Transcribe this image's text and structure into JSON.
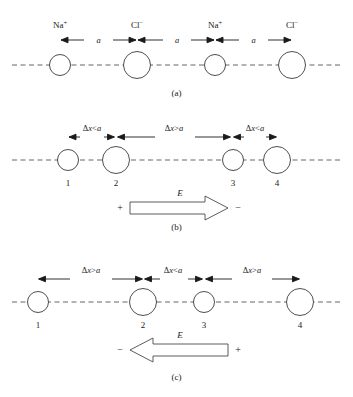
{
  "figure": {
    "panels": [
      {
        "id": "a",
        "caption": "(a)",
        "caption_y": 94,
        "axis_y": 65,
        "ions": [
          {
            "index": 1,
            "label_base": "Na",
            "label_sup": "+",
            "cx": 60,
            "r": 10.5,
            "species": "sodium"
          },
          {
            "index": 2,
            "label_base": "Cl",
            "label_sup": "−",
            "cx": 137,
            "r": 13.5,
            "species": "chloride"
          },
          {
            "index": 3,
            "label_base": "Na",
            "label_sup": "+",
            "cx": 215,
            "r": 10.5,
            "species": "sodium"
          },
          {
            "index": 4,
            "label_base": "Cl",
            "label_sup": "−",
            "cx": 292,
            "r": 13.5,
            "species": "chloride"
          }
        ],
        "dimensions": [
          {
            "from": 60,
            "to": 137,
            "label": "a",
            "relation": "equal"
          },
          {
            "from": 137,
            "to": 215,
            "label": "a",
            "relation": "equal"
          },
          {
            "from": 215,
            "to": 292,
            "label": "a",
            "relation": "equal"
          }
        ],
        "ion_label_y": 25,
        "dim_y": 40,
        "field": null
      },
      {
        "id": "b",
        "caption": "(b)",
        "caption_y": 228,
        "axis_y": 160,
        "ions": [
          {
            "index": 1,
            "label": "1",
            "cx": 68,
            "r": 10.5
          },
          {
            "index": 2,
            "label": "2",
            "cx": 116,
            "r": 13.5
          },
          {
            "index": 3,
            "label": "3",
            "cx": 233,
            "r": 10.5
          },
          {
            "index": 4,
            "label": "4",
            "cx": 277,
            "r": 13.5
          }
        ],
        "dimensions": [
          {
            "from": 68,
            "to": 116,
            "label_dx": "Δx",
            "label_rel": "<",
            "label_a": "a",
            "relation": "less"
          },
          {
            "from": 116,
            "to": 233,
            "label_dx": "Δx",
            "label_rel": ">",
            "label_a": "a",
            "relation": "greater"
          },
          {
            "from": 233,
            "to": 277,
            "label_dx": "Δx",
            "label_rel": "<",
            "label_a": "a",
            "relation": "less"
          }
        ],
        "dim_y": 137,
        "number_y": 183,
        "field": {
          "symbol": "E",
          "direction": "right",
          "left_sign": "+",
          "right_sign": "−",
          "x_start": 130,
          "x_end": 228,
          "y": 207
        }
      },
      {
        "id": "c",
        "caption": "(c)",
        "caption_y": 378,
        "axis_y": 302,
        "ions": [
          {
            "index": 1,
            "label": "1",
            "cx": 38,
            "r": 10.5
          },
          {
            "index": 2,
            "label": "2",
            "cx": 143,
            "r": 13.5
          },
          {
            "index": 3,
            "label": "3",
            "cx": 204,
            "r": 10.5
          },
          {
            "index": 4,
            "label": "4",
            "cx": 300,
            "r": 13.5
          }
        ],
        "dimensions": [
          {
            "from": 38,
            "to": 143,
            "label_dx": "Δx",
            "label_rel": ">",
            "label_a": "a",
            "relation": "greater"
          },
          {
            "from": 143,
            "to": 204,
            "label_dx": "Δx",
            "label_rel": "<",
            "label_a": "a",
            "relation": "less"
          },
          {
            "from": 204,
            "to": 300,
            "label_dx": "Δx",
            "label_rel": ">",
            "label_a": "a",
            "relation": "greater"
          }
        ],
        "dim_y": 279,
        "number_y": 325,
        "field": {
          "symbol": "E",
          "direction": "left",
          "left_sign": "−",
          "right_sign": "+",
          "x_start": 130,
          "x_end": 228,
          "y": 348
        }
      }
    ],
    "colors": {
      "background": "#ffffff",
      "ion_outline": "#3a3a3a",
      "axis": "#555555",
      "arrow": "#1a1a1a",
      "block_arrow_outline": "#4a4a4a",
      "text": "#1a1a1a"
    }
  }
}
